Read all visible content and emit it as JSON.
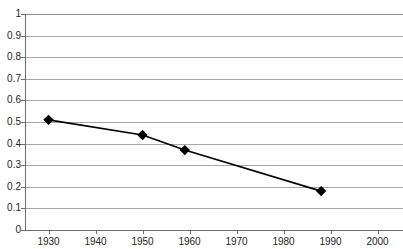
{
  "chart": {
    "title": "",
    "title_note": "title cropped off the top edge of the screenshot"
  },
  "chart_data": {
    "type": "line",
    "title": "",
    "xlabel": "",
    "ylabel": "",
    "xlim": [
      1930,
      2000
    ],
    "ylim": [
      0,
      1
    ],
    "grid": true,
    "legend": false,
    "marker": "diamond",
    "line_color": "#000000",
    "marker_color": "#000000",
    "gridline_color": "#a6a6a6",
    "x": [
      1930,
      1950,
      1959,
      1988
    ],
    "values": [
      0.51,
      0.44,
      0.37,
      0.18
    ],
    "series": [
      {
        "name": "",
        "points": [
          {
            "x": 1930,
            "y": 0.51
          },
          {
            "x": 1950,
            "y": 0.44
          },
          {
            "x": 1959,
            "y": 0.37
          },
          {
            "x": 1988,
            "y": 0.18
          }
        ]
      }
    ],
    "ytick_labels": [
      "1",
      "0.9",
      "0.8",
      "0.7",
      "0.6",
      "0.5",
      "0.4",
      "0.3",
      "0.2",
      "0.1",
      "0"
    ],
    "ytick_values": [
      1,
      0.9,
      0.8,
      0.7,
      0.6,
      0.5,
      0.4,
      0.3,
      0.2,
      0.1,
      0
    ],
    "xtick_labels": [
      "1930",
      "1940",
      "1950",
      "1960",
      "1970",
      "1980",
      "1990",
      "2000"
    ],
    "xtick_values": [
      1930,
      1940,
      1950,
      1960,
      1970,
      1980,
      1990,
      2000
    ]
  }
}
